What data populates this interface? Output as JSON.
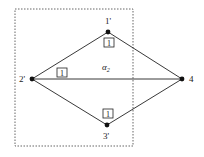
{
  "diagram": {
    "nodes": [
      {
        "id": "1'",
        "label": "1'",
        "x": 108,
        "y": 32
      },
      {
        "id": "2'",
        "label": "2'",
        "x": 32,
        "y": 79
      },
      {
        "id": "3'",
        "label": "3'",
        "x": 107,
        "y": 125
      },
      {
        "id": "4",
        "label": "4",
        "x": 182,
        "y": 79
      }
    ],
    "edges": [
      {
        "from": "2'",
        "to": "1'",
        "weight": "1"
      },
      {
        "from": "1'",
        "to": "4",
        "weight": ""
      },
      {
        "from": "2'",
        "to": "4",
        "weight": "1"
      },
      {
        "from": "2'",
        "to": "3'",
        "weight": ""
      },
      {
        "from": "3'",
        "to": "4",
        "weight": "1"
      }
    ],
    "weight_boxes": [
      {
        "text": "1",
        "x": 110,
        "y": 43
      },
      {
        "text": "1",
        "x": 62,
        "y": 72
      },
      {
        "text": "1",
        "x": 108,
        "y": 113
      }
    ],
    "region_label": "α",
    "region_label_sub": "2",
    "colors": {
      "line": "#222222",
      "dashed_box": "#555555"
    }
  }
}
